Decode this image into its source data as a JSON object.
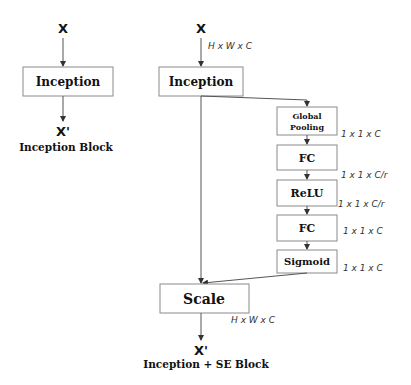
{
  "left_block": {
    "input": "X",
    "module": "Inception",
    "output": "X'",
    "caption": "Inception Block"
  },
  "right_block": {
    "input": "X",
    "input_dim": "H x W x C",
    "module": "Inception",
    "se_branch": [
      {
        "label_line1": "Global",
        "label_line2": "Pooling",
        "dim": "1 x 1 x C"
      },
      {
        "label": "FC",
        "dim": "1 x 1 x C/r"
      },
      {
        "label": "ReLU",
        "dim": "1 x 1 x C/r"
      },
      {
        "label": "FC",
        "dim": "1 x 1 x C"
      },
      {
        "label": "Sigmoid",
        "dim": "1 x 1 x C"
      }
    ],
    "scale": "Scale",
    "output_dim": "H x W x C",
    "output": "X'",
    "caption": "Inception + SE Block"
  },
  "colors": {
    "box_border": "#8a8a8a",
    "line": "#555555",
    "text": "#111111",
    "background": "#ffffff"
  }
}
